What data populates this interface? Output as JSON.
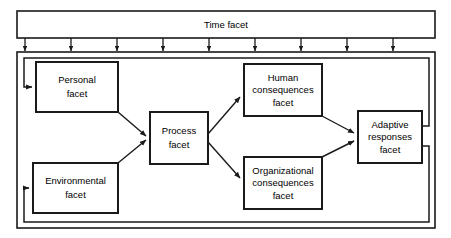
{
  "diagram": {
    "type": "flow-diagram",
    "colors": {
      "stroke": "#1a1a1a",
      "fill": "#ffffff",
      "text": "#000000",
      "background": "#ffffff"
    },
    "time_band": {
      "label": "Time facet",
      "tick_arrow_count": 9
    },
    "boxes": [
      {
        "id": "personal",
        "lines": [
          "Personal",
          "facet"
        ],
        "line1": "Personal",
        "line2": "facet",
        "x": 36,
        "y": 62,
        "w": 82,
        "h": 50
      },
      {
        "id": "environmental",
        "lines": [
          "Environmental",
          "facet"
        ],
        "line1": "Environmental",
        "line2": "facet",
        "x": 33,
        "y": 163,
        "w": 85,
        "h": 50
      },
      {
        "id": "process",
        "lines": [
          "Process",
          "facet"
        ],
        "line1": "Process",
        "line2": "facet",
        "x": 150,
        "y": 112,
        "w": 58,
        "h": 52
      },
      {
        "id": "human-consequences",
        "lines": [
          "Human",
          "consequences",
          "facet"
        ],
        "line1": "Human",
        "line2": "consequences",
        "line3": "facet",
        "x": 244,
        "y": 64,
        "w": 78,
        "h": 52
      },
      {
        "id": "organizational-consequences",
        "lines": [
          "Organizational",
          "consequences",
          "facet"
        ],
        "line1": "Organizational",
        "line2": "consequences",
        "line3": "facet",
        "x": 244,
        "y": 157,
        "w": 78,
        "h": 52
      },
      {
        "id": "adaptive-responses",
        "lines": [
          "Adaptive",
          "responses",
          "facet"
        ],
        "line1": "Adaptive",
        "line2": "responses",
        "line3": "facet",
        "x": 358,
        "y": 111,
        "w": 64,
        "h": 52
      }
    ],
    "connections": [
      {
        "from": "personal",
        "to": "process",
        "kind": "arrow"
      },
      {
        "from": "environmental",
        "to": "process",
        "kind": "arrow"
      },
      {
        "from": "process",
        "to": "human-consequences",
        "kind": "arrow"
      },
      {
        "from": "process",
        "to": "organizational-consequences",
        "kind": "arrow"
      },
      {
        "from": "human-consequences",
        "to": "adaptive-responses",
        "kind": "arrow"
      },
      {
        "from": "organizational-consequences",
        "to": "adaptive-responses",
        "kind": "arrow"
      },
      {
        "from": "adaptive-responses",
        "to": "personal",
        "kind": "feedback-loop-upper"
      },
      {
        "from": "adaptive-responses",
        "to": "environmental",
        "kind": "feedback-loop-lower"
      },
      {
        "from": "time-facet",
        "to": "outer-container",
        "kind": "tick-arrows"
      }
    ]
  }
}
